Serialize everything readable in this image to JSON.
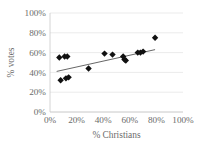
{
  "chart_data": {
    "type": "scatter",
    "title": "",
    "xlabel": "% Christians",
    "ylabel": "% votes",
    "xlim": [
      0,
      100
    ],
    "ylim": [
      0,
      100
    ],
    "grid": true,
    "legend": false,
    "xticks": [
      "0%",
      "20%",
      "40%",
      "60%",
      "80%",
      "100%"
    ],
    "yticks": [
      "0%",
      "20%",
      "40%",
      "60%",
      "80%",
      "100%"
    ],
    "xtick_values": [
      0,
      20,
      40,
      60,
      80,
      100
    ],
    "ytick_values": [
      0,
      20,
      40,
      60,
      80,
      100
    ],
    "series": [
      {
        "name": "observations",
        "marker": "diamond",
        "color": "#111111",
        "points": [
          {
            "x": 7,
            "y": 55
          },
          {
            "x": 11,
            "y": 56
          },
          {
            "x": 13,
            "y": 56
          },
          {
            "x": 8,
            "y": 32
          },
          {
            "x": 12,
            "y": 34
          },
          {
            "x": 14,
            "y": 35
          },
          {
            "x": 29,
            "y": 44
          },
          {
            "x": 41,
            "y": 59
          },
          {
            "x": 47,
            "y": 58
          },
          {
            "x": 55,
            "y": 56
          },
          {
            "x": 56,
            "y": 53
          },
          {
            "x": 57,
            "y": 52
          },
          {
            "x": 66,
            "y": 60
          },
          {
            "x": 68,
            "y": 60
          },
          {
            "x": 70,
            "y": 61
          },
          {
            "x": 79,
            "y": 75
          }
        ]
      }
    ],
    "trendline": {
      "name": "linear fit",
      "x0": 5,
      "y0": 41,
      "x1": 79,
      "y1": 63,
      "color": "#4a4a4a"
    }
  },
  "axes": {
    "x_title": "% Christians",
    "y_title": "% votes"
  }
}
